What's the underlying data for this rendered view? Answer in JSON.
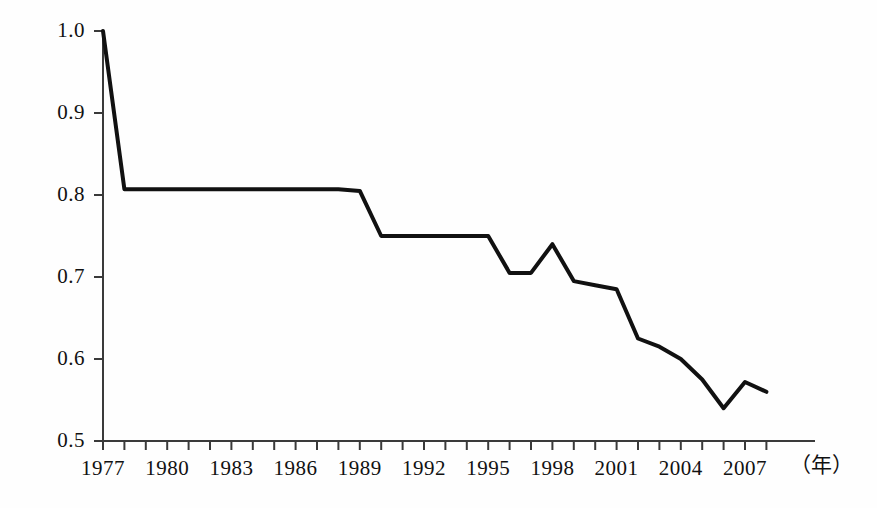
{
  "chart_data": {
    "type": "line",
    "title": "",
    "subtitle": "",
    "xlabel": "(年)",
    "ylabel": "",
    "xlim": [
      1977,
      2008
    ],
    "ylim": [
      0.5,
      1.0
    ],
    "grid": false,
    "legend": null,
    "axis": {
      "y_ticks": [
        0.5,
        0.6,
        0.7,
        0.8,
        0.9,
        1.0
      ],
      "y_tick_labels": [
        "0.5",
        "0.6",
        "0.7",
        "0.8",
        "0.9",
        "1.0"
      ],
      "x_ticks": [
        1977,
        1978,
        1979,
        1980,
        1981,
        1982,
        1983,
        1984,
        1985,
        1986,
        1987,
        1988,
        1989,
        1990,
        1991,
        1992,
        1993,
        1994,
        1995,
        1996,
        1997,
        1998,
        1999,
        2000,
        2001,
        2002,
        2003,
        2004,
        2005,
        2006,
        2007,
        2008
      ],
      "x_tick_labels": [
        "1977",
        "1980",
        "1983",
        "1986",
        "1989",
        "1992",
        "1995",
        "1998",
        "2001",
        "2004",
        "2007"
      ],
      "x_labeled_years": [
        1977,
        1980,
        1983,
        1986,
        1989,
        1992,
        1995,
        1998,
        2001,
        2004,
        2007
      ],
      "x_minor_tick_interval": 1,
      "x_label_interval": 3,
      "unit_suffix": "(年)"
    },
    "series": [
      {
        "name": "value",
        "color": "#111111",
        "line_width": 4,
        "x": [
          1977,
          1978,
          1979,
          1980,
          1981,
          1982,
          1983,
          1984,
          1985,
          1986,
          1987,
          1988,
          1989,
          1990,
          1991,
          1992,
          1993,
          1994,
          1995,
          1996,
          1997,
          1998,
          1999,
          2000,
          2001,
          2002,
          2003,
          2004,
          2005,
          2006,
          2007,
          2008
        ],
        "values": [
          1.0,
          0.807,
          0.807,
          0.807,
          0.807,
          0.807,
          0.807,
          0.807,
          0.807,
          0.807,
          0.807,
          0.807,
          0.805,
          0.75,
          0.75,
          0.75,
          0.75,
          0.75,
          0.75,
          0.705,
          0.705,
          0.74,
          0.695,
          0.69,
          0.685,
          0.625,
          0.615,
          0.6,
          0.575,
          0.54,
          0.572,
          0.56
        ]
      }
    ]
  },
  "geometry": {
    "plot_left_px": 103,
    "plot_right_px": 815,
    "y_top_px": 31,
    "y_bottom_px": 441,
    "px_per_year": 21.4,
    "px_per_tenth": 82
  },
  "labels": {
    "y": [
      "1.0",
      "0.9",
      "0.8",
      "0.7",
      "0.6",
      "0.5"
    ],
    "x": [
      "1977",
      "1980",
      "1983",
      "1986",
      "1989",
      "1992",
      "1995",
      "1998",
      "2001",
      "2004",
      "2007"
    ],
    "unit": "（年）"
  }
}
